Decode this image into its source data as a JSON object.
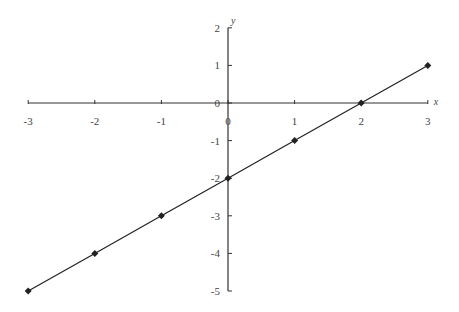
{
  "chart_data": {
    "type": "line",
    "title": "",
    "xlabel": "x",
    "ylabel": "y",
    "xlim": [
      -3,
      3
    ],
    "ylim": [
      -5,
      2
    ],
    "grid": false,
    "x_ticks": [
      -3,
      -2,
      -1,
      0,
      1,
      2,
      3
    ],
    "y_ticks": [
      2,
      1,
      0,
      -1,
      -2,
      -3,
      -4,
      -5
    ],
    "series": [
      {
        "name": "y = x - 2",
        "x": [
          -3,
          -2,
          -1,
          0,
          1,
          2,
          3
        ],
        "values": [
          -5,
          -4,
          -3,
          -2,
          -1,
          0,
          1
        ],
        "marker": "diamond",
        "color": "#222222"
      }
    ]
  },
  "axes": {
    "x_label": "x",
    "y_label": "y",
    "x_tick_labels": [
      "-3",
      "-2",
      "-1",
      "0",
      "1",
      "2",
      "3"
    ],
    "y_tick_labels": [
      "2",
      "1",
      "0",
      "-1",
      "-2",
      "-3",
      "-4",
      "-5"
    ]
  }
}
